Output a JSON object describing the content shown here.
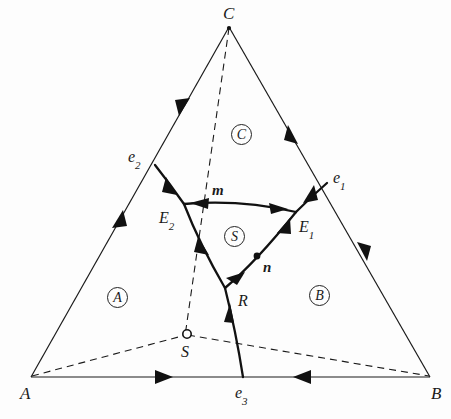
{
  "figure": {
    "type": "ternary-phase-diagram",
    "background_color": "#fdfdfd",
    "line_color": "#1a1a1a"
  },
  "vertices": [
    {
      "id": "A",
      "label": "A",
      "x": 31,
      "y": 377,
      "label_x": 20,
      "label_y": 385
    },
    {
      "id": "B",
      "label": "B",
      "x": 430,
      "y": 377,
      "label_x": 431,
      "label_y": 385
    },
    {
      "id": "C",
      "label": "C",
      "x": 229,
      "y": 27,
      "label_x": 223,
      "label_y": 5
    }
  ],
  "binary_eutectics": [
    {
      "id": "e1",
      "label": "e",
      "sub": "1",
      "x": 327,
      "y": 183,
      "label_x": 333,
      "label_y": 170
    },
    {
      "id": "e2",
      "label": "e",
      "sub": "2",
      "x": 155,
      "y": 165,
      "label_x": 128,
      "label_y": 149
    },
    {
      "id": "e3",
      "label": "e",
      "sub": "3",
      "x": 243,
      "y": 377,
      "label_x": 235,
      "label_y": 385
    }
  ],
  "ternary_eutectics": [
    {
      "id": "E1",
      "label": "E",
      "sub": "1",
      "x": 296,
      "y": 212,
      "label_x": 299,
      "label_y": 219
    },
    {
      "id": "E2",
      "label": "E",
      "sub": "2",
      "x": 184,
      "y": 204,
      "label_x": 159,
      "label_y": 210
    }
  ],
  "special_points": [
    {
      "id": "R",
      "label": "R",
      "x": 225,
      "y": 288,
      "label_x": 238,
      "label_y": 293,
      "kind": "reaction-point"
    },
    {
      "id": "S",
      "label": "S",
      "x": 187,
      "y": 334,
      "label_x": 181,
      "label_y": 344,
      "kind": "compound-composition",
      "marker": "open-circle"
    },
    {
      "id": "m",
      "label": "m",
      "x": 237,
      "y": 207,
      "label_x": 212,
      "label_y": 183,
      "kind": "temperature-maximum"
    },
    {
      "id": "n",
      "label": "n",
      "x": 258,
      "y": 255,
      "label_x": 263,
      "label_y": 260,
      "kind": "temperature-maximum"
    }
  ],
  "phase_fields": [
    {
      "id": "A",
      "label": "A",
      "x": 107,
      "y": 287
    },
    {
      "id": "B",
      "label": "B",
      "x": 309,
      "y": 285
    },
    {
      "id": "C",
      "label": "C",
      "x": 231,
      "y": 124
    },
    {
      "id": "S",
      "label": "S",
      "x": 224,
      "y": 226
    }
  ],
  "edges": [
    {
      "id": "A-C",
      "from": "A",
      "to": "C",
      "style": "solid",
      "arrows": [
        "toward-e2-from-A",
        "toward-e2-from-C"
      ]
    },
    {
      "id": "C-B",
      "from": "C",
      "to": "B",
      "style": "solid",
      "arrows": [
        "toward-e1-from-C",
        "toward-e1-from-B"
      ]
    },
    {
      "id": "A-B",
      "from": "A",
      "to": "B",
      "style": "solid",
      "arrows": [
        "toward-e3-from-A",
        "toward-e3-from-B"
      ]
    }
  ],
  "boundary_curves": [
    {
      "id": "e2-E2",
      "from": "e2",
      "to": "E2",
      "style": "solid-bold",
      "arrow_direction": "toward-E2"
    },
    {
      "id": "e1-E1",
      "from": "e1",
      "to": "E1",
      "style": "solid-bold",
      "arrow_direction": "toward-E1"
    },
    {
      "id": "E2-m-E1",
      "from": "E2",
      "to": "E1",
      "via": "m",
      "style": "solid-bold",
      "arrow_direction": "both-away-from-m"
    },
    {
      "id": "E2-R",
      "from": "E2",
      "to": "R",
      "style": "solid-bold",
      "arrow_direction": "toward-R"
    },
    {
      "id": "R-n-E1",
      "from": "R",
      "to": "E1",
      "via": "n",
      "style": "solid-bold",
      "arrow_direction": "toward-E1"
    },
    {
      "id": "e3-R",
      "from": "e3",
      "to": "R",
      "style": "solid-bold",
      "arrow_direction": "toward-R"
    }
  ],
  "construction_lines": [
    {
      "id": "C-S",
      "from": "C",
      "to": "S",
      "style": "dashed",
      "note": "alkemade line C to S extended"
    },
    {
      "id": "A-S",
      "from": "A",
      "to": "S",
      "style": "dashed",
      "note": "alkemade line A to S"
    },
    {
      "id": "S-B",
      "from": "S",
      "to": "B",
      "style": "dashed",
      "note": "alkemade line S to B"
    }
  ]
}
